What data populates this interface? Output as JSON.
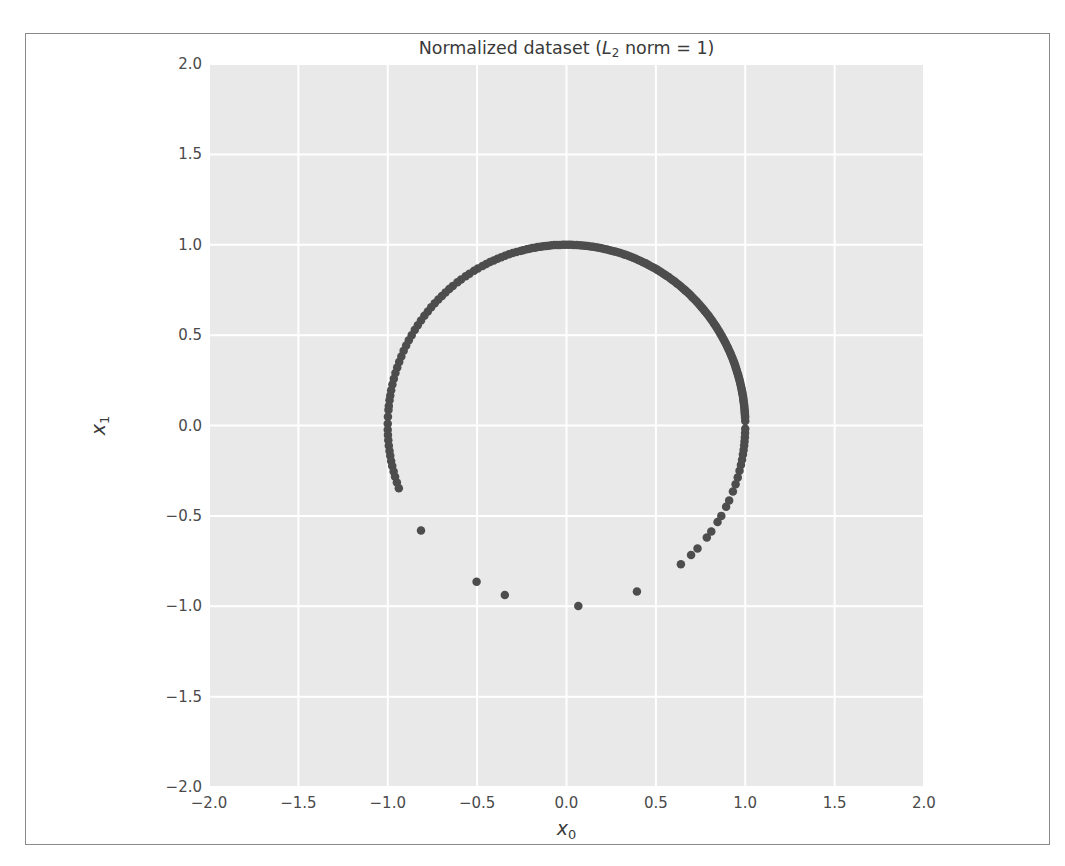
{
  "figure": {
    "background_color": "#ffffff",
    "frame_border_color": "#8a8a8a",
    "plot_background_color": "#e9e9e9",
    "grid_color": "#ffffff",
    "point_color": "#4d4d4d"
  },
  "chart_data": {
    "type": "scatter",
    "title_parts": {
      "prefix": "Normalized dataset (",
      "italic": "L",
      "sub": "2",
      "suffix": " norm = 1)"
    },
    "xlabel": "x₀",
    "ylabel": "x₁",
    "xlabel_parts": {
      "italic": "x",
      "sub": "0"
    },
    "ylabel_parts": {
      "italic": "x",
      "sub": "1"
    },
    "xlim": [
      -2.0,
      2.0
    ],
    "ylim": [
      -2.0,
      2.0
    ],
    "xticks": [
      "-2.0",
      "-1.5",
      "-1.0",
      "-0.5",
      "0.0",
      "0.5",
      "1.0",
      "1.5",
      "2.0"
    ],
    "yticks": [
      "2.0",
      "1.5",
      "1.0",
      "0.5",
      "0.0",
      "-0.5",
      "-1.0",
      "-1.5",
      "-2.0"
    ],
    "xtick_values": [
      -2.0,
      -1.5,
      -1.0,
      -0.5,
      0.0,
      0.5,
      1.0,
      1.5,
      2.0
    ],
    "ytick_values": [
      2.0,
      1.5,
      1.0,
      0.5,
      0.0,
      -0.5,
      -1.0,
      -1.5,
      -2.0
    ],
    "grid": true,
    "legend": "none",
    "marker_size": 8.5,
    "series": [
      {
        "name": "normalized samples",
        "color": "#4d4d4d",
        "points": [
          [
            1.0,
            0.025
          ],
          [
            0.999,
            0.046
          ],
          [
            0.999,
            0.052
          ],
          [
            0.998,
            0.062
          ],
          [
            0.998,
            0.07
          ],
          [
            0.997,
            0.078
          ],
          [
            0.996,
            0.088
          ],
          [
            0.995,
            0.1
          ],
          [
            0.994,
            0.11
          ],
          [
            0.993,
            0.119
          ],
          [
            0.992,
            0.127
          ],
          [
            0.99,
            0.138
          ],
          [
            0.989,
            0.148
          ],
          [
            0.988,
            0.157
          ],
          [
            0.986,
            0.167
          ],
          [
            0.984,
            0.178
          ],
          [
            0.982,
            0.188
          ],
          [
            0.98,
            0.199
          ],
          [
            0.978,
            0.209
          ],
          [
            0.976,
            0.219
          ],
          [
            0.973,
            0.23
          ],
          [
            0.971,
            0.24
          ],
          [
            0.968,
            0.251
          ],
          [
            0.965,
            0.262
          ],
          [
            0.962,
            0.273
          ],
          [
            0.959,
            0.284
          ],
          [
            0.955,
            0.295
          ],
          [
            0.952,
            0.306
          ],
          [
            0.948,
            0.317
          ],
          [
            0.945,
            0.328
          ],
          [
            0.941,
            0.339
          ],
          [
            0.937,
            0.35
          ],
          [
            0.932,
            0.362
          ],
          [
            0.928,
            0.373
          ],
          [
            0.923,
            0.385
          ],
          [
            0.919,
            0.395
          ],
          [
            0.914,
            0.406
          ],
          [
            0.908,
            0.419
          ],
          [
            0.903,
            0.43
          ],
          [
            0.898,
            0.44
          ],
          [
            0.892,
            0.452
          ],
          [
            0.886,
            0.463
          ],
          [
            0.88,
            0.475
          ],
          [
            0.874,
            0.486
          ],
          [
            0.868,
            0.497
          ],
          [
            0.861,
            0.508
          ],
          [
            0.855,
            0.519
          ],
          [
            0.848,
            0.53
          ],
          [
            0.841,
            0.541
          ],
          [
            0.834,
            0.552
          ],
          [
            0.826,
            0.563
          ],
          [
            0.819,
            0.574
          ],
          [
            0.811,
            0.585
          ],
          [
            0.803,
            0.596
          ],
          [
            0.795,
            0.607
          ],
          [
            0.787,
            0.617
          ],
          [
            0.778,
            0.628
          ],
          [
            0.77,
            0.638
          ],
          [
            0.761,
            0.649
          ],
          [
            0.752,
            0.659
          ],
          [
            0.743,
            0.669
          ],
          [
            0.733,
            0.68
          ],
          [
            0.724,
            0.69
          ],
          [
            0.714,
            0.7
          ],
          [
            0.704,
            0.71
          ],
          [
            0.694,
            0.72
          ],
          [
            0.684,
            0.73
          ],
          [
            0.673,
            0.74
          ],
          [
            0.663,
            0.749
          ],
          [
            0.652,
            0.758
          ],
          [
            0.641,
            0.768
          ],
          [
            0.63,
            0.777
          ],
          [
            0.618,
            0.786
          ],
          [
            0.607,
            0.795
          ],
          [
            0.595,
            0.804
          ],
          [
            0.583,
            0.812
          ],
          [
            0.571,
            0.821
          ],
          [
            0.559,
            0.829
          ],
          [
            0.547,
            0.837
          ],
          [
            0.534,
            0.845
          ],
          [
            0.521,
            0.853
          ],
          [
            0.509,
            0.861
          ],
          [
            0.496,
            0.868
          ],
          [
            0.483,
            0.876
          ],
          [
            0.469,
            0.883
          ],
          [
            0.456,
            0.89
          ],
          [
            0.443,
            0.897
          ],
          [
            0.429,
            0.903
          ],
          [
            0.415,
            0.91
          ],
          [
            0.401,
            0.916
          ],
          [
            0.387,
            0.922
          ],
          [
            0.373,
            0.928
          ],
          [
            0.359,
            0.933
          ],
          [
            0.345,
            0.939
          ],
          [
            0.33,
            0.944
          ],
          [
            0.316,
            0.949
          ],
          [
            0.301,
            0.954
          ],
          [
            0.286,
            0.958
          ],
          [
            0.272,
            0.962
          ],
          [
            0.257,
            0.966
          ],
          [
            0.242,
            0.97
          ],
          [
            0.227,
            0.974
          ],
          [
            0.212,
            0.977
          ],
          [
            0.196,
            0.981
          ],
          [
            0.181,
            0.983
          ],
          [
            0.166,
            0.986
          ],
          [
            0.15,
            0.989
          ],
          [
            0.135,
            0.991
          ],
          [
            0.119,
            0.993
          ],
          [
            0.104,
            0.995
          ],
          [
            0.088,
            0.996
          ],
          [
            0.073,
            0.997
          ],
          [
            0.057,
            0.998
          ],
          [
            0.041,
            0.999
          ],
          [
            0.026,
            1.0
          ],
          [
            0.01,
            1.0
          ],
          [
            -0.006,
            1.0
          ],
          [
            -0.021,
            1.0
          ],
          [
            -0.037,
            0.999
          ],
          [
            -0.052,
            0.999
          ],
          [
            -0.068,
            0.998
          ],
          [
            -0.083,
            0.997
          ],
          [
            -0.099,
            0.995
          ],
          [
            -0.114,
            0.993
          ],
          [
            -0.13,
            0.992
          ],
          [
            -0.145,
            0.989
          ],
          [
            -0.161,
            0.987
          ],
          [
            -0.176,
            0.984
          ],
          [
            -0.191,
            0.982
          ],
          [
            -0.207,
            0.978
          ],
          [
            -0.222,
            0.975
          ],
          [
            -0.243,
            0.97
          ],
          [
            -0.258,
            0.966
          ],
          [
            -0.28,
            0.96
          ],
          [
            -0.301,
            0.954
          ],
          [
            -0.322,
            0.947
          ],
          [
            -0.344,
            0.939
          ],
          [
            -0.365,
            0.931
          ],
          [
            -0.386,
            0.922
          ],
          [
            -0.407,
            0.913
          ],
          [
            -0.428,
            0.904
          ],
          [
            -0.449,
            0.894
          ],
          [
            -0.47,
            0.883
          ],
          [
            -0.496,
            0.868
          ],
          [
            -0.517,
            0.856
          ],
          [
            -0.543,
            0.84
          ],
          [
            -0.564,
            0.826
          ],
          [
            -0.59,
            0.808
          ],
          [
            -0.61,
            0.792
          ],
          [
            -0.636,
            0.772
          ],
          [
            -0.656,
            0.755
          ],
          [
            -0.677,
            0.736
          ],
          [
            -0.697,
            0.717
          ],
          [
            -0.717,
            0.697
          ],
          [
            -0.737,
            0.676
          ],
          [
            -0.757,
            0.654
          ],
          [
            -0.776,
            0.631
          ],
          [
            -0.795,
            0.607
          ],
          [
            -0.814,
            0.581
          ],
          [
            -0.832,
            0.555
          ],
          [
            -0.849,
            0.529
          ],
          [
            -0.866,
            0.5
          ],
          [
            -0.882,
            0.472
          ],
          [
            -0.897,
            0.442
          ],
          [
            -0.911,
            0.413
          ],
          [
            -0.924,
            0.382
          ],
          [
            -0.936,
            0.352
          ],
          [
            -0.947,
            0.321
          ],
          [
            -0.957,
            0.291
          ],
          [
            -0.966,
            0.258
          ],
          [
            -0.974,
            0.227
          ],
          [
            -0.981,
            0.195
          ],
          [
            -0.986,
            0.166
          ],
          [
            -0.99,
            0.14
          ],
          [
            -0.994,
            0.108
          ],
          [
            -0.996,
            0.086
          ],
          [
            -0.999,
            0.048
          ],
          [
            -1.0,
            0.01
          ],
          [
            -1.0,
            -0.024
          ],
          [
            -0.999,
            -0.052
          ],
          [
            -0.997,
            -0.082
          ],
          [
            -0.994,
            -0.112
          ],
          [
            -0.99,
            -0.141
          ],
          [
            -0.986,
            -0.167
          ],
          [
            -0.981,
            -0.196
          ],
          [
            -0.975,
            -0.224
          ],
          [
            -0.967,
            -0.254
          ],
          [
            -0.959,
            -0.283
          ],
          [
            -0.949,
            -0.315
          ],
          [
            -0.938,
            -0.347
          ],
          [
            -0.814,
            -0.581
          ],
          [
            -0.503,
            -0.864
          ],
          [
            -0.345,
            -0.938
          ],
          [
            0.066,
            -0.998
          ],
          [
            0.394,
            -0.919
          ],
          [
            0.64,
            -0.768
          ],
          [
            0.697,
            -0.717
          ],
          [
            0.733,
            -0.68
          ],
          [
            0.785,
            -0.62
          ],
          [
            0.81,
            -0.586
          ],
          [
            0.845,
            -0.534
          ],
          [
            0.866,
            -0.5
          ],
          [
            0.893,
            -0.45
          ],
          [
            0.91,
            -0.415
          ],
          [
            0.931,
            -0.365
          ],
          [
            0.946,
            -0.325
          ],
          [
            0.958,
            -0.287
          ],
          [
            0.968,
            -0.25
          ],
          [
            0.976,
            -0.218
          ],
          [
            0.982,
            -0.19
          ],
          [
            0.987,
            -0.16
          ],
          [
            0.991,
            -0.135
          ],
          [
            0.994,
            -0.11
          ],
          [
            0.996,
            -0.088
          ],
          [
            0.998,
            -0.065
          ],
          [
            0.999,
            -0.042
          ],
          [
            1.0,
            -0.018
          ]
        ]
      }
    ]
  }
}
